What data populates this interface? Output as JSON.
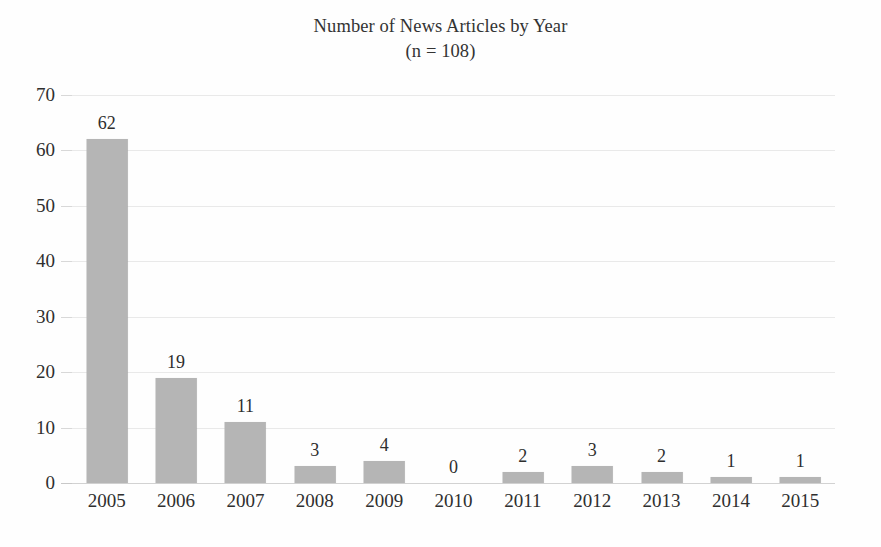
{
  "chart_data": {
    "type": "bar",
    "title": "Number of News Articles by Year",
    "subtitle": "(n = 108)",
    "xlabel": "",
    "ylabel": "",
    "categories": [
      "2005",
      "2006",
      "2007",
      "2008",
      "2009",
      "2010",
      "2011",
      "2012",
      "2013",
      "2014",
      "2015"
    ],
    "values": [
      62,
      19,
      11,
      3,
      4,
      0,
      2,
      3,
      2,
      1,
      1
    ],
    "data_labels": [
      "62",
      "19",
      "11",
      "3",
      "4",
      "0",
      "2",
      "3",
      "2",
      "1",
      "1"
    ],
    "ylim": [
      0,
      70
    ],
    "yticks": [
      0,
      10,
      20,
      30,
      40,
      50,
      60,
      70
    ],
    "ytick_labels": [
      "0",
      "10",
      "20",
      "30",
      "40",
      "50",
      "60",
      "70"
    ],
    "grid": true,
    "grid_axis": "y",
    "legend": false,
    "legend_position": "none",
    "bar_color": "#b5b5b5",
    "gridline_color": "#e9e9e9",
    "axis_color": "#d2d2d2",
    "text_color": "#2f2f2f",
    "background_color": "#fefefe",
    "total": 108
  }
}
